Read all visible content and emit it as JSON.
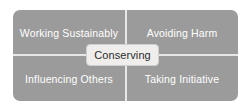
{
  "diagram": {
    "panel": {
      "fill_color": "#9b9b9b",
      "divider_color": "#e7e7e7",
      "corner_radius_px": 7
    },
    "quadrants": [
      {
        "position": "top-left",
        "label": "Working Sustainably",
        "text_color": "#ffffff"
      },
      {
        "position": "top-right",
        "label": "Avoiding Harm",
        "text_color": "#ffffff"
      },
      {
        "position": "bottom-left",
        "label": "Influencing Others",
        "text_color": "#ffffff"
      },
      {
        "position": "bottom-right",
        "label": "Taking Initiative",
        "text_color": "#ffffff"
      }
    ],
    "center": {
      "label": "Conserving",
      "fill_color": "#efeeec",
      "border_color": "#cfcfcf",
      "text_color": "#2b2b2b"
    },
    "background_color": "#ffffff"
  }
}
